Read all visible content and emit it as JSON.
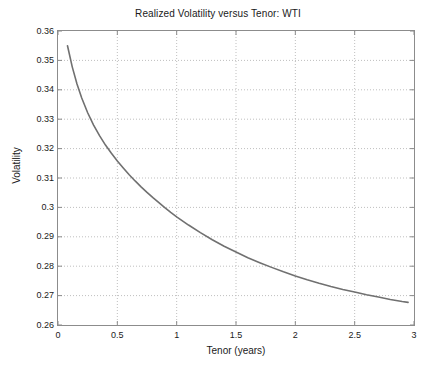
{
  "figure": {
    "background_color": "#ffffff",
    "axes_color": "#8c8c8c",
    "grid_color": "#bfbfbf",
    "line_color": "#707070",
    "text_color": "#1a1a1a"
  },
  "chart_data": {
    "type": "line",
    "title": "Realized Volatility versus Tenor: WTI",
    "xlabel": "Tenor (years)",
    "ylabel": "Volatility",
    "xlim": [
      0,
      3
    ],
    "ylim": [
      0.26,
      0.36
    ],
    "xticks": [
      0,
      0.5,
      1,
      1.5,
      2,
      2.5,
      3
    ],
    "xticklabels": [
      "0",
      "0.5",
      "1",
      "1.5",
      "2",
      "2.5",
      "3"
    ],
    "yticks": [
      0.26,
      0.27,
      0.28,
      0.29,
      0.3,
      0.31,
      0.32,
      0.33,
      0.34,
      0.35,
      0.36
    ],
    "yticklabels": [
      "0.26",
      "0.27",
      "0.28",
      "0.29",
      "0.3",
      "0.31",
      "0.32",
      "0.33",
      "0.34",
      "0.35",
      "0.36"
    ],
    "grid": true,
    "grid_style": "dotted",
    "legend": null,
    "series": [
      {
        "name": "Realized Volatility",
        "color": "#707070",
        "linewidth": 1.6,
        "x": [
          0.08,
          0.12,
          0.16,
          0.2,
          0.25,
          0.3,
          0.35,
          0.4,
          0.45,
          0.5,
          0.55,
          0.6,
          0.65,
          0.7,
          0.75,
          0.8,
          0.85,
          0.9,
          0.95,
          1.0,
          1.1,
          1.2,
          1.3,
          1.4,
          1.5,
          1.6,
          1.7,
          1.8,
          1.9,
          2.0,
          2.1,
          2.2,
          2.3,
          2.4,
          2.5,
          2.6,
          2.7,
          2.8,
          2.9,
          2.95
        ],
        "y": [
          0.355,
          0.3478,
          0.342,
          0.3372,
          0.3322,
          0.328,
          0.3244,
          0.3212,
          0.3184,
          0.3158,
          0.3134,
          0.3111,
          0.309,
          0.307,
          0.3051,
          0.3033,
          0.3016,
          0.2999,
          0.2983,
          0.2968,
          0.294,
          0.2914,
          0.289,
          0.2868,
          0.2848,
          0.2829,
          0.2812,
          0.2796,
          0.2781,
          0.2767,
          0.2754,
          0.2742,
          0.2731,
          0.2721,
          0.2712,
          0.2703,
          0.2695,
          0.2687,
          0.268,
          0.2677
        ]
      }
    ]
  }
}
